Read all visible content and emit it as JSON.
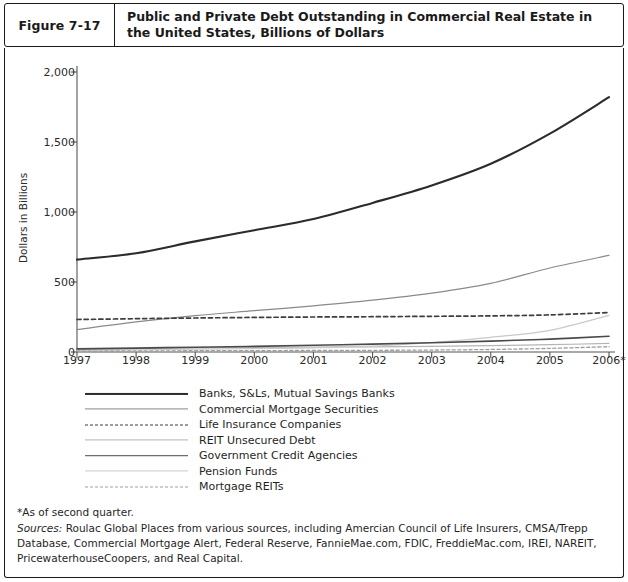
{
  "figure": {
    "number": "Figure 7-17",
    "title": "Public and Private Debt Outstanding in Commercial Real Estate in the United States, Billions of Dollars"
  },
  "notes": {
    "asterisk": "*As of second quarter.",
    "sources_label": "Sources:",
    "sources_text": " Roulac Global Places from various sources, including Amercian Council of Life Insurers, CMSA/Trepp Database, Commercial Mortgage Alert, Federal Reserve, FannieMae.com, FDIC, FreddieMac.com, IREI, NAREIT, PricewaterhouseCoopers, and Real Capital."
  },
  "colors": {
    "banks": "#2b2b2b",
    "cmbs": "#8a8a8a",
    "life_insurance": "#3d3d3d",
    "reit_unsecured": "#b4b4b4",
    "government_credit": "#4a4a4a",
    "pension_funds": "#c9c9c9",
    "mortgage_reits": "#9e9e9e",
    "axis": "#555555",
    "border": "#1a1a1a",
    "text": "#1f1f1f"
  },
  "chart_data": {
    "type": "line",
    "title": "Public and Private Debt Outstanding in Commercial Real Estate in the United States, Billions of Dollars",
    "xlabel": "",
    "ylabel": "Dollars in Billions",
    "grid": false,
    "legend_position": "below",
    "ylim": [
      0,
      2000
    ],
    "yticks": [
      0,
      500,
      1000,
      1500,
      2000
    ],
    "ytick_labels": [
      "0",
      "500",
      "1,000",
      "1,500",
      "2,000"
    ],
    "categories": [
      "1997",
      "1998",
      "1999",
      "2000",
      "2001",
      "2002",
      "2003",
      "2004",
      "2005",
      "2006*"
    ],
    "series": [
      {
        "name": "Banks, S&Ls, Mutual Savings Banks",
        "style": "solid",
        "width": 2.1,
        "color_key": "banks",
        "values": [
          660,
          705,
          790,
          870,
          950,
          1065,
          1190,
          1345,
          1560,
          1820
        ]
      },
      {
        "name": "Commercial Mortgage Securities",
        "style": "solid",
        "width": 1.2,
        "color_key": "cmbs",
        "values": [
          160,
          215,
          260,
          295,
          330,
          370,
          420,
          490,
          600,
          690
        ]
      },
      {
        "name": "Life Insurance Companies",
        "style": "dashed",
        "width": 1.7,
        "color_key": "life_insurance",
        "values": [
          232,
          238,
          243,
          247,
          250,
          252,
          255,
          258,
          265,
          282
        ]
      },
      {
        "name": "REIT Unsecured Debt",
        "style": "solid",
        "width": 1.2,
        "color_key": "reit_unsecured",
        "values": [
          18,
          24,
          30,
          33,
          35,
          37,
          40,
          45,
          52,
          62
        ]
      },
      {
        "name": "Government Credit Agencies",
        "style": "solid",
        "width": 1.6,
        "color_key": "government_credit",
        "values": [
          22,
          28,
          34,
          40,
          48,
          56,
          66,
          78,
          92,
          112
        ]
      },
      {
        "name": "Pension Funds",
        "style": "solid",
        "width": 1.2,
        "color_key": "pension_funds",
        "values": [
          12,
          16,
          20,
          24,
          30,
          42,
          68,
          105,
          155,
          262
        ]
      },
      {
        "name": "Mortgage REITs",
        "style": "dashed",
        "width": 1.3,
        "color_key": "mortgage_reits",
        "values": [
          6,
          8,
          9,
          10,
          11,
          12,
          14,
          18,
          26,
          38
        ]
      }
    ]
  }
}
